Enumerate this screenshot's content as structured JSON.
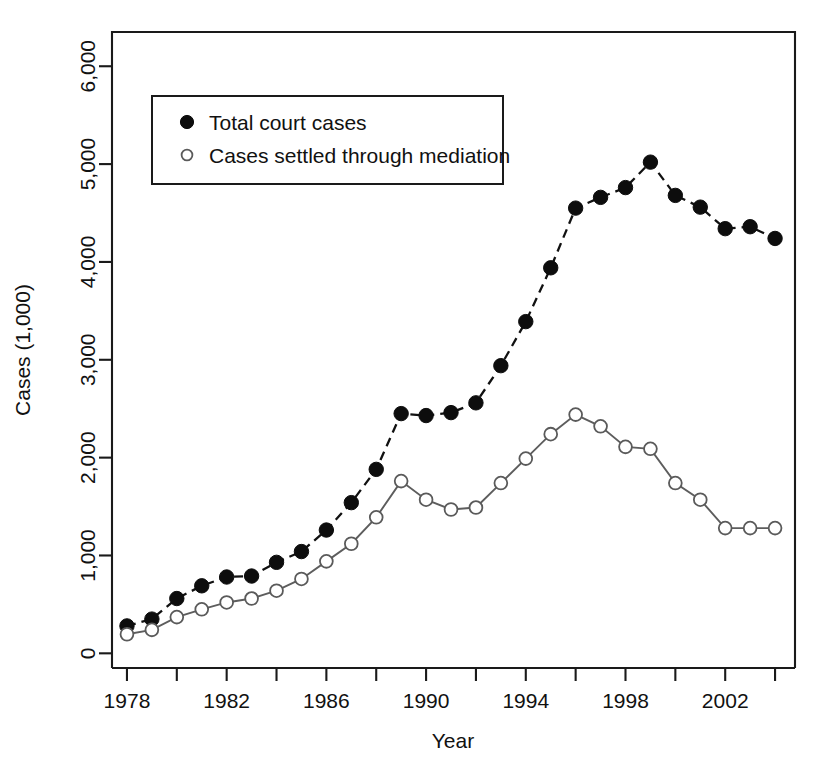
{
  "chart_data": {
    "type": "line",
    "title": "",
    "xlabel": "Year",
    "ylabel": "Cases (1,000)",
    "xlim": [
      1977.4,
      2004.8
    ],
    "ylim": [
      -150,
      6350
    ],
    "grid": false,
    "legend_position": "top-left-inside",
    "x": [
      1978,
      1979,
      1980,
      1981,
      1982,
      1983,
      1984,
      1985,
      1986,
      1987,
      1988,
      1989,
      1990,
      1991,
      1992,
      1993,
      1994,
      1995,
      1996,
      1997,
      1998,
      1999,
      2000,
      2001,
      2002,
      2003,
      2004
    ],
    "xtick_values": [
      1978,
      1980,
      1982,
      1984,
      1986,
      1988,
      1990,
      1992,
      1994,
      1996,
      1998,
      2000,
      2002,
      2004
    ],
    "xtick_labels": [
      "1978",
      "",
      "1982",
      "",
      "1986",
      "",
      "1990",
      "",
      "1994",
      "",
      "1998",
      "",
      "2002",
      ""
    ],
    "ytick_values": [
      0,
      1000,
      2000,
      3000,
      4000,
      5000,
      6000
    ],
    "ytick_labels": [
      "0",
      "1,000",
      "2,000",
      "3,000",
      "4,000",
      "5,000",
      "6,000"
    ],
    "series": [
      {
        "name": "Total court cases",
        "marker": "filled-circle",
        "linestyle": "dashed",
        "color": "#111111",
        "values": [
          280,
          350,
          560,
          690,
          780,
          790,
          930,
          1040,
          1260,
          1540,
          1880,
          2450,
          2430,
          2460,
          2560,
          2940,
          3390,
          3940,
          4550,
          4660,
          4760,
          5020,
          4680,
          4560,
          4340,
          4360,
          4240
        ]
      },
      {
        "name": "Cases settled through mediation",
        "marker": "open-circle",
        "linestyle": "solid",
        "color": "#5d5d5d",
        "values": [
          195,
          240,
          370,
          450,
          520,
          560,
          640,
          760,
          940,
          1120,
          1390,
          1760,
          1570,
          1470,
          1490,
          1740,
          1990,
          2240,
          2440,
          2320,
          2110,
          2090,
          1740,
          1570,
          1280,
          1280,
          1280
        ]
      }
    ]
  },
  "legend": {
    "entries": [
      {
        "label": "Total court cases",
        "marker": "filled-circle"
      },
      {
        "label": "Cases settled through mediation",
        "marker": "open-circle"
      }
    ]
  },
  "axes": {
    "x_title": "Year",
    "y_title": "Cases (1,000)"
  }
}
